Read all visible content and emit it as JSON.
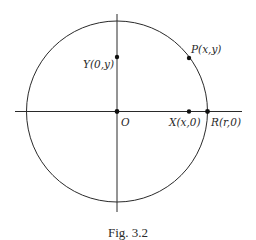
{
  "figure": {
    "caption": "Fig. 3.2",
    "colors": {
      "stroke": "#2a2a2a",
      "point": "#111111",
      "background": "#ffffff"
    },
    "circle": {
      "center": "O",
      "radius_point": "R"
    },
    "axes": {
      "horizontal": "x-axis",
      "vertical": "y-axis"
    },
    "points": [
      {
        "id": "O",
        "label": "O"
      },
      {
        "id": "P",
        "label": "P(x,y)"
      },
      {
        "id": "X",
        "label": "X(x,0)"
      },
      {
        "id": "Y",
        "label": "Y(0,y)"
      },
      {
        "id": "R",
        "label": "R(r,0)"
      }
    ]
  }
}
